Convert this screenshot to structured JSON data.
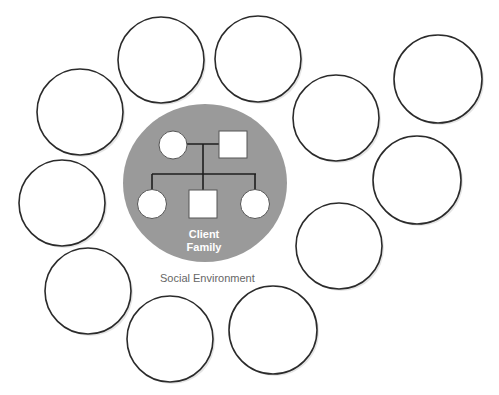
{
  "diagram": {
    "type": "ecomap",
    "center": {
      "label_line1": "Client",
      "label_line2": "Family",
      "fill": "#9a9a9a",
      "genogram": {
        "parents": [
          {
            "shape": "circle",
            "sex": "female"
          },
          {
            "shape": "square",
            "sex": "male"
          }
        ],
        "children": [
          {
            "shape": "circle",
            "sex": "female"
          },
          {
            "shape": "square",
            "sex": "male"
          },
          {
            "shape": "circle",
            "sex": "female"
          }
        ]
      }
    },
    "environment_label": "Social Environment",
    "outer_circles": [
      {
        "id": "c1",
        "label": ""
      },
      {
        "id": "c2",
        "label": ""
      },
      {
        "id": "c3",
        "label": ""
      },
      {
        "id": "c4",
        "label": ""
      },
      {
        "id": "c5",
        "label": ""
      },
      {
        "id": "c6",
        "label": ""
      },
      {
        "id": "c7",
        "label": ""
      },
      {
        "id": "c8",
        "label": ""
      },
      {
        "id": "c9",
        "label": ""
      },
      {
        "id": "c10",
        "label": ""
      },
      {
        "id": "c11",
        "label": ""
      }
    ]
  }
}
